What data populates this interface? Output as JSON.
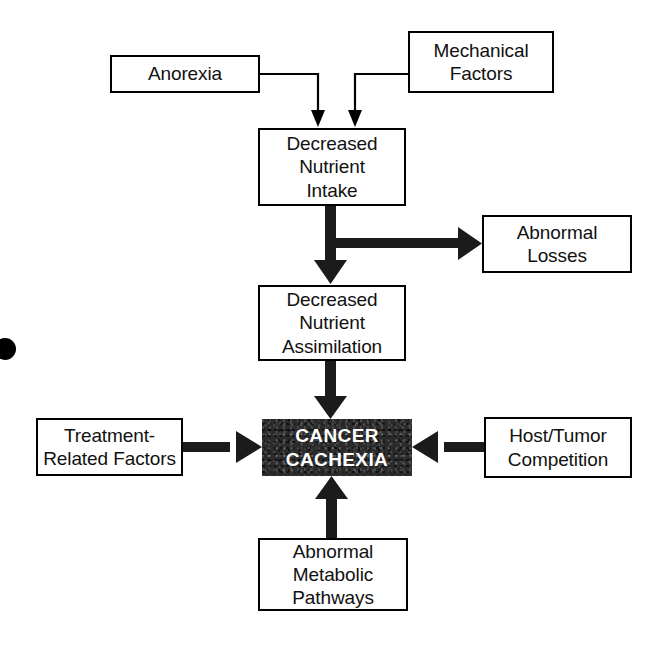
{
  "diagram": {
    "background_color": "#ffffff",
    "line_color": "#000000",
    "emphasis_fill": "#2b2b2b",
    "emphasis_text_color": "#ffffff",
    "nodes": [
      {
        "id": "anorexia",
        "label": "Anorexia",
        "x": 110,
        "y": 55,
        "w": 150,
        "h": 38,
        "style": "outline"
      },
      {
        "id": "mechanical-factors",
        "label": "Mechanical\nFactors",
        "x": 408,
        "y": 31,
        "w": 146,
        "h": 62,
        "style": "outline"
      },
      {
        "id": "decreased-nutrient-intake",
        "label": "Decreased\nNutrient\nIntake",
        "x": 258,
        "y": 128,
        "w": 148,
        "h": 78,
        "style": "outline"
      },
      {
        "id": "abnormal-losses",
        "label": "Abnormal\nLosses",
        "x": 482,
        "y": 215,
        "w": 150,
        "h": 58,
        "style": "outline"
      },
      {
        "id": "decreased-nutrient-assimilation",
        "label": "Decreased\nNutrient\nAssimilation",
        "x": 258,
        "y": 285,
        "w": 148,
        "h": 76,
        "style": "outline"
      },
      {
        "id": "treatment-related-factors",
        "label": "Treatment-\nRelated Factors",
        "x": 36,
        "y": 418,
        "w": 147,
        "h": 58,
        "style": "outline"
      },
      {
        "id": "cancer-cachexia",
        "label": "CANCER\nCACHEXIA",
        "x": 262,
        "y": 419,
        "w": 150,
        "h": 57,
        "style": "emphasis"
      },
      {
        "id": "host-tumor-competition",
        "label": "Host/Tumor\nCompetition",
        "x": 484,
        "y": 417,
        "w": 148,
        "h": 61,
        "style": "outline"
      },
      {
        "id": "abnormal-metabolic-pathways",
        "label": "Abnormal\nMetabolic\nPathways",
        "x": 258,
        "y": 538,
        "w": 150,
        "h": 73,
        "style": "outline"
      }
    ],
    "edges": [
      {
        "id": "anorexia-to-intake",
        "from": "anorexia",
        "to": "decreased-nutrient-intake",
        "weight": "thin",
        "shape": "elbow-right-down"
      },
      {
        "id": "mechanical-to-intake",
        "from": "mechanical-factors",
        "to": "decreased-nutrient-intake",
        "weight": "thin",
        "shape": "elbow-left-down"
      },
      {
        "id": "intake-to-assimilation",
        "from": "decreased-nutrient-intake",
        "to": "decreased-nutrient-assimilation",
        "weight": "thick",
        "shape": "down"
      },
      {
        "id": "intake-to-abnormal-losses",
        "from": "decreased-nutrient-intake",
        "to": "abnormal-losses",
        "weight": "thick",
        "shape": "right"
      },
      {
        "id": "assimilation-to-cachexia",
        "from": "decreased-nutrient-assimilation",
        "to": "cancer-cachexia",
        "weight": "thick",
        "shape": "down"
      },
      {
        "id": "treatment-to-cachexia",
        "from": "treatment-related-factors",
        "to": "cancer-cachexia",
        "weight": "thick",
        "shape": "right"
      },
      {
        "id": "host-tumor-to-cachexia",
        "from": "host-tumor-competition",
        "to": "cancer-cachexia",
        "weight": "thick",
        "shape": "left"
      },
      {
        "id": "metabolic-to-cachexia",
        "from": "abnormal-metabolic-pathways",
        "to": "cancer-cachexia",
        "weight": "thick",
        "shape": "up"
      }
    ],
    "artifacts": [
      {
        "id": "scan-blot",
        "x": -6,
        "y": 338,
        "w": 22,
        "h": 22
      }
    ]
  }
}
